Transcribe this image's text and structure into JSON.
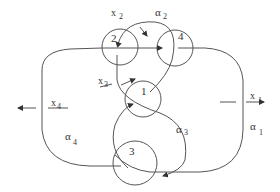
{
  "diagram": {
    "type": "knot-diagram",
    "stroke_color": "#555555",
    "text_color": "#333333",
    "crossings": [
      {
        "id": "c1",
        "label": "1"
      },
      {
        "id": "c2",
        "label": "2"
      },
      {
        "id": "c3",
        "label": "3"
      },
      {
        "id": "c4",
        "label": "4"
      }
    ],
    "generators": [
      {
        "id": "x1",
        "base": "x",
        "sub": "1"
      },
      {
        "id": "x2",
        "base": "x",
        "sub": "2"
      },
      {
        "id": "x3",
        "base": "x",
        "sub": "3"
      },
      {
        "id": "x4",
        "base": "x",
        "sub": "4"
      }
    ],
    "arcs": [
      {
        "id": "a1",
        "base": "α",
        "sub": "1"
      },
      {
        "id": "a2",
        "base": "α",
        "sub": "2"
      },
      {
        "id": "a3",
        "base": "α",
        "sub": "3"
      },
      {
        "id": "a4",
        "base": "α",
        "sub": "4"
      }
    ]
  }
}
